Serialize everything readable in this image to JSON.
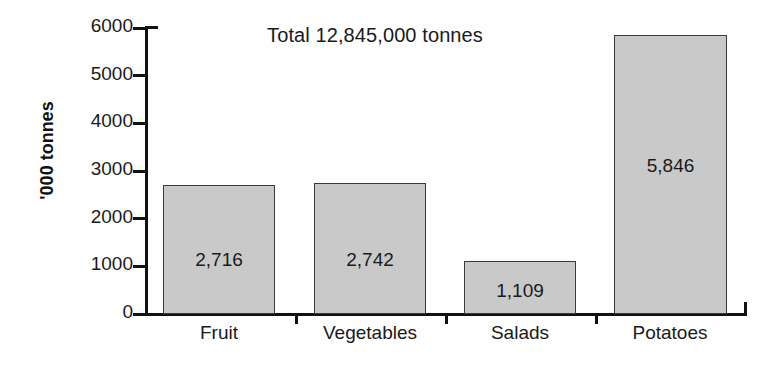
{
  "chart_data": {
    "type": "bar",
    "title": "Total 12,845,000 tonnes",
    "xlabel": "",
    "ylabel": "'000 tonnes",
    "categories": [
      "Fruit",
      "Vegetables",
      "Salads",
      "Potatoes"
    ],
    "values": [
      2716,
      2742,
      1109,
      5846
    ],
    "value_labels": [
      "2,716",
      "2,742",
      "1,109",
      "5,846"
    ],
    "ylim": [
      0,
      6000
    ],
    "y_ticks": [
      0,
      1000,
      2000,
      3000,
      4000,
      5000,
      6000
    ],
    "y_tick_labels": [
      "0",
      "1000",
      "2000",
      "3000",
      "4000",
      "5000",
      "6000"
    ],
    "grid": false,
    "legend": null,
    "bar_color": "#c9c9c9",
    "bar_edge_color": "#3a3a3a",
    "axis_color": "#111111",
    "background": "#fefefe"
  }
}
